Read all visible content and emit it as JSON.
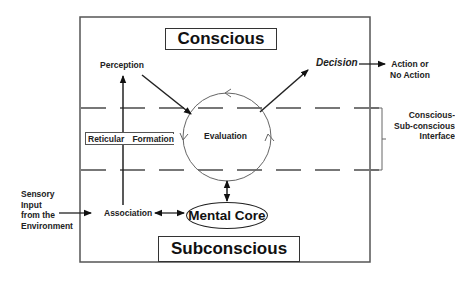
{
  "diagram": {
    "title_conscious": "Conscious",
    "title_subconscious": "Subconscious",
    "nodes": {
      "perception": "Perception",
      "decision": "Decision",
      "evaluation": "Evaluation",
      "reticular_formation_left": "Reticular",
      "reticular_formation_right": "Formation",
      "association": "Association",
      "mental_core": "Mental Core"
    },
    "external": {
      "sensory_input": [
        "Sensory",
        "Input",
        "from the",
        "Environment"
      ],
      "action": [
        "Action or",
        "No Action"
      ],
      "interface": [
        "Conscious-",
        "Sub-conscious",
        "Interface"
      ]
    },
    "edges": [
      {
        "from": "Association",
        "to": "Perception",
        "type": "arrow"
      },
      {
        "from": "Perception",
        "to": "Evaluation",
        "type": "arrow"
      },
      {
        "from": "Evaluation",
        "to": "Decision",
        "type": "arrow"
      },
      {
        "from": "Decision",
        "to": "Action or No Action",
        "type": "arrow"
      },
      {
        "from": "Sensory Input from the Environment",
        "to": "Association",
        "type": "arrow"
      },
      {
        "from": "Association",
        "to": "Mental Core",
        "type": "double-arrow"
      },
      {
        "from": "Evaluation",
        "to": "Mental Core",
        "type": "double-arrow"
      }
    ],
    "colors": {
      "line": "#333333",
      "dash": "#777777",
      "circle": "#666666",
      "text": "#222222"
    }
  }
}
